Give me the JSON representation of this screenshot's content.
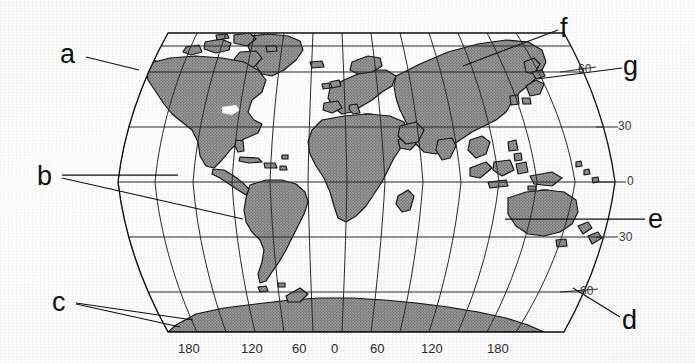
{
  "figure": {
    "kind": "world-map",
    "projection": "robinson-style pseudocylindrical"
  },
  "colors": {
    "paper": "#ffffff",
    "ink": "#1a1a1a",
    "land_fill": "#9a9a9a",
    "land_stipple": "#6f6f6f",
    "coastline": "#111111",
    "graticule": "#2a2a2a",
    "label_text": "#111111",
    "tick_text": "#2b2b2b"
  },
  "labels": [
    {
      "id": "a",
      "text": "a",
      "x": 60,
      "y": 41,
      "target": "alaska-northwest-north-america"
    },
    {
      "id": "b",
      "text": "b",
      "x": 37,
      "y": 163,
      "target": "south-america"
    },
    {
      "id": "c",
      "text": "c",
      "x": 52,
      "y": 289,
      "target": "antarctica"
    },
    {
      "id": "d",
      "text": "d",
      "x": 622,
      "y": 307,
      "target": "southern-ocean-latitude-60-south"
    },
    {
      "id": "e",
      "text": "e",
      "x": 648,
      "y": 206,
      "target": "australia"
    },
    {
      "id": "f",
      "text": "f",
      "x": 560,
      "y": 15,
      "target": "northern-asia-siberia"
    },
    {
      "id": "g",
      "text": "g",
      "x": 623,
      "y": 53,
      "target": "japan-northeast-asia-coast"
    }
  ],
  "leaders": [
    {
      "label": "a",
      "points": "86,57 139,70"
    },
    {
      "label": "b",
      "points": "62,175 178,175"
    },
    {
      "label": "b",
      "points": "62,178 243,219"
    },
    {
      "label": "c",
      "points": "76,303 193,320"
    },
    {
      "label": "c",
      "points": "76,304 180,327"
    },
    {
      "label": "d",
      "points": "620,317 573,288"
    },
    {
      "label": "e",
      "points": "645,219 505,219"
    },
    {
      "label": "f",
      "points": "558,30 463,66"
    },
    {
      "label": "g",
      "points": "622,68 537,79"
    }
  ],
  "longitude_ticks": {
    "axis": "bottom",
    "unit": "degrees",
    "items": [
      {
        "label": "180",
        "x": 178
      },
      {
        "label": "120",
        "x": 241
      },
      {
        "label": "60",
        "x": 292
      },
      {
        "label": "0",
        "x": 331
      },
      {
        "label": "60",
        "x": 370
      },
      {
        "label": "120",
        "x": 421
      },
      {
        "label": "180",
        "x": 487
      }
    ],
    "y": 342
  },
  "latitude_ticks": {
    "axis": "right",
    "unit": "degrees",
    "items": [
      {
        "label": "60",
        "x": 578,
        "y": 63,
        "hemisphere": "north"
      },
      {
        "label": "30",
        "x": 618,
        "y": 120,
        "hemisphere": "north"
      },
      {
        "label": "0",
        "x": 627,
        "y": 175,
        "hemisphere": "equator"
      },
      {
        "label": "30",
        "x": 619,
        "y": 231,
        "hemisphere": "south"
      },
      {
        "label": "60",
        "x": 580,
        "y": 285,
        "hemisphere": "south"
      }
    ]
  },
  "graticule": {
    "parallels_deg": [
      75,
      60,
      30,
      0,
      -30,
      -60
    ],
    "meridians_deg": [
      -180,
      -150,
      -120,
      -90,
      -60,
      -30,
      0,
      30,
      60,
      90,
      120,
      150,
      180
    ],
    "frame": {
      "left": 118,
      "right": 615,
      "top": 33,
      "bottom": 332,
      "center_x": 366,
      "center_y": 182
    }
  }
}
